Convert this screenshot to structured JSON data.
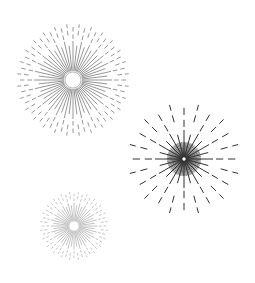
{
  "canvas": {
    "width": 255,
    "height": 283,
    "background": "#ffffff"
  },
  "starbursts": [
    {
      "name": "large-light-starburst",
      "cx": 73,
      "cy": 80,
      "hole_radius": 8,
      "inner_radius": 9,
      "solid_length": 30,
      "outer_radius": 56,
      "ray_count": 56,
      "dash_start": 41,
      "color": "#8a8a8a",
      "stroke_width": 0.9
    },
    {
      "name": "dark-starburst",
      "cx": 184,
      "cy": 159,
      "hole_radius": 2.5,
      "inner_radius": 3,
      "solid_length": 26,
      "outer_radius": 56,
      "ray_count": 24,
      "dash_start": 32,
      "color": "#333333",
      "stroke_width": 1.0,
      "dense_ray_count": 72,
      "dense_length": 14
    },
    {
      "name": "small-faint-starburst",
      "cx": 74,
      "cy": 226,
      "hole_radius": 5,
      "inner_radius": 5.5,
      "solid_length": 18,
      "outer_radius": 34,
      "ray_count": 48,
      "dash_start": 25,
      "color": "#b4b4b4",
      "stroke_width": 0.8
    }
  ]
}
